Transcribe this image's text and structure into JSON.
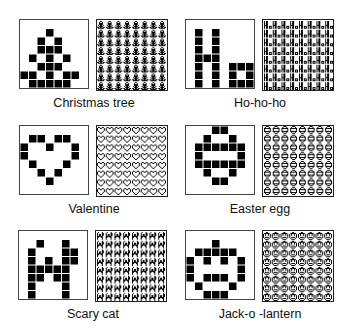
{
  "patterns": [
    {
      "name": "christmas-tree",
      "label": "Christmas tree",
      "grid": [
        "00000000",
        "00010000",
        "00101000",
        "00111000",
        "01010100",
        "00111000",
        "11010110",
        "01111100"
      ]
    },
    {
      "name": "ho-ho-ho",
      "label": "Ho-ho-ho",
      "grid": [
        "00000000",
        "01010000",
        "01010000",
        "01010000",
        "01110000",
        "01010111",
        "01010101",
        "01010111"
      ]
    },
    {
      "name": "valentine",
      "label": "Valentine",
      "grid": [
        "00000000",
        "01101100",
        "10010010",
        "10000010",
        "01000100",
        "00101000",
        "00010000",
        "00000000"
      ]
    },
    {
      "name": "easter-egg",
      "label": "Easter egg",
      "grid": [
        "00011000",
        "00100100",
        "01111110",
        "01000010",
        "01111110",
        "00100100",
        "00011000",
        "00000000"
      ]
    },
    {
      "name": "scary-cat",
      "label": "Scary cat",
      "grid": [
        "00000000",
        "00100100",
        "01000110",
        "01010110",
        "01111100",
        "01101100",
        "01000100",
        "01000100"
      ]
    },
    {
      "name": "jack-o-lantern",
      "label": "Jack-o -lantern",
      "grid": [
        "00000000",
        "00010000",
        "01111100",
        "10101010",
        "10000010",
        "10111010",
        "01000100",
        "00111000"
      ]
    }
  ],
  "colors": {
    "ink": "#000000",
    "paper": "#ffffff"
  }
}
